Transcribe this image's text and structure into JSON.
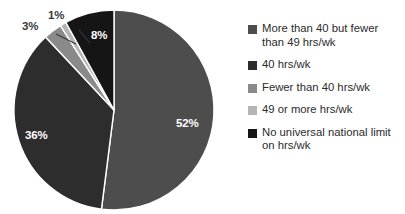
{
  "chart_data": {
    "type": "pie",
    "title": "",
    "xlabel": "",
    "ylabel": "",
    "legend_position": "right",
    "start_angle_deg": 0,
    "direction": "clockwise",
    "categories": [
      "More than 40 but fewer than 49 hrs/wk",
      "40 hrs/wk",
      "Fewer than 40 hrs/wk",
      "49 or more hrs/wk",
      "No universal national limit on hrs/wk"
    ],
    "values": [
      52,
      36,
      3,
      1,
      8
    ],
    "value_labels": [
      "52%",
      "36%",
      "3%",
      "1%",
      "8%"
    ],
    "colors": [
      "#4d4d4d",
      "#2d2d2d",
      "#8a8a8a",
      "#b5b5b5",
      "#151515"
    ],
    "label_placement": [
      "inside",
      "inside",
      "outside",
      "outside",
      "inside"
    ],
    "separator_color": "#ffffff"
  },
  "slice_labels": {
    "s52": "52%",
    "s36": "36%",
    "s3": "3%",
    "s1": "1%",
    "s8": "8%"
  },
  "legend": {
    "items": [
      {
        "label": "More than 40 but fewer than 49 hrs/wk",
        "color": "#4d4d4d"
      },
      {
        "label": "40 hrs/wk",
        "color": "#2d2d2d"
      },
      {
        "label": "Fewer than 40 hrs/wk",
        "color": "#8a8a8a"
      },
      {
        "label": "49 or more hrs/wk",
        "color": "#b5b5b5"
      },
      {
        "label": "No universal national limit on hrs/wk",
        "color": "#151515"
      }
    ]
  }
}
